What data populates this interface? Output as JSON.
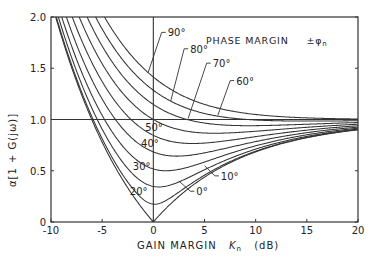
{
  "chart_data": {
    "type": "line",
    "title": "PHASE MARGIN  ±φn",
    "xlabel": "GAIN MARGIN  Kn  (dB)",
    "ylabel": "α[1 + G(jω)]",
    "xlim": [
      -10,
      20
    ],
    "ylim": [
      0,
      2.0
    ],
    "xticks": [
      -10,
      -5,
      0,
      5,
      10,
      15,
      20
    ],
    "xtick_labels": [
      "-10",
      "-5",
      "0",
      "5",
      "10",
      "15",
      "20"
    ],
    "yticks": [
      0,
      0.5,
      1.0,
      1.5,
      2.0
    ],
    "ytick_labels": [
      "0",
      "0.5",
      "1.0",
      "1.5",
      "2.0"
    ],
    "grid": false,
    "reference_lines": {
      "horizontal_y": 1.0,
      "vertical_x": 0
    },
    "formula": "alpha = sqrt(1 + r^2 - 2 r cos(phi)), r = 10^(-Kn/20)",
    "x": [
      -10,
      -5,
      0,
      5,
      10,
      15,
      20
    ],
    "series": [
      {
        "name": "0°",
        "phase_deg": 0,
        "values": [
          2.16,
          0.78,
          0.0,
          0.44,
          0.68,
          0.82,
          0.9
        ]
      },
      {
        "name": "10°",
        "phase_deg": 10,
        "values": [
          2.18,
          0.81,
          0.17,
          0.46,
          0.69,
          0.83,
          0.9
        ]
      },
      {
        "name": "20°",
        "phase_deg": 20,
        "values": [
          2.25,
          0.91,
          0.35,
          0.51,
          0.71,
          0.84,
          0.91
        ]
      },
      {
        "name": "30°",
        "phase_deg": 30,
        "values": [
          2.35,
          1.04,
          0.52,
          0.58,
          0.74,
          0.85,
          0.92
        ]
      },
      {
        "name": "40°",
        "phase_deg": 40,
        "values": [
          2.48,
          1.2,
          0.68,
          0.67,
          0.79,
          0.87,
          0.93
        ]
      },
      {
        "name": "50°",
        "phase_deg": 50,
        "values": [
          2.63,
          1.37,
          0.85,
          0.77,
          0.83,
          0.9,
          0.94
        ]
      },
      {
        "name": "60°",
        "phase_deg": 60,
        "values": [
          2.8,
          1.54,
          1.0,
          0.87,
          0.89,
          0.92,
          0.95
        ]
      },
      {
        "name": "70°",
        "phase_deg": 70,
        "values": [
          2.97,
          1.72,
          1.15,
          0.97,
          0.94,
          0.95,
          0.97
        ]
      },
      {
        "name": "80°",
        "phase_deg": 80,
        "values": [
          3.15,
          1.88,
          1.29,
          1.06,
          1.0,
          0.98,
          0.99
        ]
      },
      {
        "name": "90°",
        "phase_deg": 90,
        "values": [
          3.32,
          2.04,
          1.41,
          1.15,
          1.05,
          1.02,
          1.0
        ]
      }
    ],
    "curve_labels": [
      {
        "text": "0°",
        "x": 4.2,
        "y": 0.3,
        "leader_to": [
          2.5,
          0.4
        ]
      },
      {
        "text": "10°",
        "x": 6.6,
        "y": 0.45,
        "leader_to": [
          5.0,
          0.55
        ]
      },
      {
        "text": "20°",
        "x": -2.3,
        "y": 0.3
      },
      {
        "text": "30°",
        "x": -2.0,
        "y": 0.55
      },
      {
        "text": "40°",
        "x": -1.2,
        "y": 0.77
      },
      {
        "text": "50°",
        "x": -0.8,
        "y": 0.93
      },
      {
        "text": "60°",
        "x": 8.1,
        "y": 1.38,
        "leader_to": [
          6.3,
          1.04
        ]
      },
      {
        "text": "70°",
        "x": 5.8,
        "y": 1.55,
        "leader_to": [
          3.4,
          1.01
        ]
      },
      {
        "text": "80°",
        "x": 3.6,
        "y": 1.69,
        "leader_to": [
          1.7,
          1.18
        ]
      },
      {
        "text": "90°",
        "x": 1.4,
        "y": 1.85,
        "leader_to": [
          -0.5,
          1.46
        ]
      }
    ]
  },
  "labels": {
    "title": "PHASE  MARGIN",
    "title_symbol": "±φ",
    "title_subscript": "n",
    "xlabel_main": "GAIN  MARGIN",
    "xlabel_var": "K",
    "xlabel_sub": "n",
    "xlabel_unit": "(dB)",
    "ylabel": "α[1 + G(jω)]"
  },
  "colors": {
    "line": "#333333",
    "background": "#ffffff",
    "text": "#222222"
  }
}
